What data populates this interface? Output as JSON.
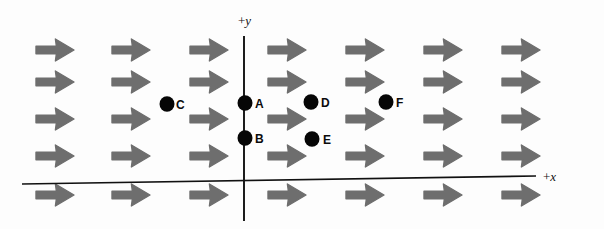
{
  "figure": {
    "name": "uniform-vector-field-diagram",
    "background_color": "#fdfdfd",
    "width": 604,
    "height": 229
  },
  "axes": {
    "y_axis_label": "+y",
    "x_axis_label": "+x",
    "axis_color": "#111111",
    "y_axis": {
      "x": 244,
      "y_top": 36,
      "y_bottom": 221
    },
    "x_axis": {
      "x_left": 22,
      "y_left": 184,
      "x_right": 536,
      "y_right": 176
    },
    "y_label_pos": {
      "x": 238,
      "y": 14
    },
    "x_label_pos": {
      "x": 543,
      "y": 170
    }
  },
  "field": {
    "type": "uniform-vector-field",
    "arrow_direction": "right",
    "arrow_color": "#6e6e6e",
    "arrow_count": 35,
    "columns": 7,
    "rows": 5,
    "column_x": [
      36,
      112,
      190,
      268,
      346,
      424,
      502
    ],
    "row_y": [
      50,
      82,
      119,
      156,
      195
    ],
    "arrow_width": 38,
    "arrow_height": 22
  },
  "points": [
    {
      "label": "C",
      "x": 167,
      "y": 104,
      "label_x": 176,
      "label_y": 99,
      "radius": 7.5,
      "color": "#060606"
    },
    {
      "label": "A",
      "x": 245,
      "y": 103,
      "label_x": 255,
      "label_y": 98,
      "radius": 7.5,
      "color": "#060606"
    },
    {
      "label": "D",
      "x": 311,
      "y": 102,
      "label_x": 321,
      "label_y": 97,
      "radius": 7.5,
      "color": "#060606"
    },
    {
      "label": "F",
      "x": 386,
      "y": 102,
      "label_x": 396,
      "label_y": 97,
      "radius": 7.5,
      "color": "#060606"
    },
    {
      "label": "B",
      "x": 245,
      "y": 138,
      "label_x": 255,
      "label_y": 133,
      "radius": 7.5,
      "color": "#060606"
    },
    {
      "label": "E",
      "x": 312,
      "y": 139,
      "label_x": 323,
      "label_y": 134,
      "radius": 7.5,
      "color": "#060606"
    }
  ]
}
